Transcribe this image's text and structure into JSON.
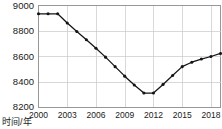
{
  "chart_data": {
    "type": "line",
    "title": "",
    "subtitle": "",
    "xlabel": "时间/年",
    "ylabel": "",
    "x": [
      2000,
      2001,
      2002,
      2003,
      2004,
      2005,
      2006,
      2007,
      2008,
      2009,
      2010,
      2011,
      2012,
      2013,
      2014,
      2015,
      2016,
      2017,
      2018,
      2019
    ],
    "values": [
      8935,
      8935,
      8935,
      8862,
      8795,
      8730,
      8663,
      8593,
      8518,
      8443,
      8373,
      8310,
      8310,
      8378,
      8448,
      8518,
      8553,
      8578,
      8598,
      8622
    ],
    "series": [
      {
        "name": "",
        "values": [
          8935,
          8935,
          8935,
          8862,
          8795,
          8730,
          8663,
          8593,
          8518,
          8443,
          8373,
          8310,
          8310,
          8378,
          8448,
          8518,
          8553,
          8578,
          8598,
          8622
        ]
      }
    ],
    "xlim": [
      2000,
      2019
    ],
    "ylim": [
      8200,
      9000
    ],
    "xticks": [
      2000,
      2003,
      2006,
      2009,
      2012,
      2015,
      2018
    ],
    "xtick_labels": [
      "2000",
      "2003",
      "2006",
      "2009",
      "2012",
      "2015",
      "2018"
    ],
    "yticks": [
      8200,
      8400,
      8600,
      8800,
      9000
    ],
    "ytick_labels": [
      "8200",
      "8400",
      "8600",
      "8800",
      "9000"
    ],
    "grid": true,
    "legend": false,
    "legend_position": "none",
    "marker": "circle",
    "line_color": "#141414",
    "grid_color": "#c9c9c9",
    "border_color": "#8c8c8c",
    "background_color": "#ffffff",
    "annotations": []
  },
  "axis": {
    "x_title": "时间/年",
    "y_title": ""
  }
}
